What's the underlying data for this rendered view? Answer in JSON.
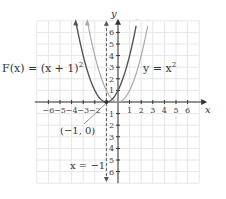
{
  "chart_data": {
    "type": "line",
    "title": "",
    "xlabel": "x",
    "ylabel": "y",
    "xlim": [
      -7,
      7
    ],
    "ylim": [
      -7,
      7
    ],
    "grid": true,
    "x_ticks": [
      -6,
      -5,
      -4,
      -3,
      -2,
      1,
      2,
      3,
      4,
      5,
      6
    ],
    "y_ticks": [
      6,
      5,
      4,
      3,
      2,
      1,
      -1,
      -2,
      -3,
      -4,
      -5,
      -6
    ],
    "series": [
      {
        "name": "F(x) = (x + 1)^2",
        "color": "#555555",
        "x": [
          -3.6,
          -3,
          -2,
          -1,
          0,
          1,
          1.6
        ],
        "y": [
          6.76,
          4,
          1,
          0,
          1,
          4,
          6.76
        ]
      },
      {
        "name": "y = x^2",
        "color": "#aaaaaa",
        "x": [
          -2.6,
          -2,
          -1,
          0,
          1,
          2,
          2.6
        ],
        "y": [
          6.76,
          4,
          1,
          0,
          1,
          4,
          6.76
        ]
      }
    ],
    "annotations": [
      {
        "text": "F(x) = (x + 1)^2",
        "target": "dark curve"
      },
      {
        "text": "y = x^2",
        "target": "light curve"
      },
      {
        "text": "(-1, 0)",
        "point": [
          -1,
          0
        ]
      },
      {
        "text": "x = -1",
        "type": "dashed vertical line (axis of symmetry)"
      }
    ]
  },
  "labels": {
    "f_label": "F(x) = (x + 1)",
    "f_exp": "2",
    "g_label": "y = x",
    "g_exp": "2",
    "vertex": "(−1, 0)",
    "axis_sym": "x = −1",
    "x_axis": "x",
    "y_axis": "y"
  },
  "ticks": {
    "x": [
      "−6",
      "−5",
      "−4",
      "−3",
      "−2",
      "1",
      "2",
      "3",
      "4",
      "5",
      "6"
    ],
    "y_pos": [
      "1",
      "2",
      "3",
      "4",
      "5",
      "6"
    ],
    "y_neg": [
      "1",
      "2",
      "3",
      "4",
      "5",
      "6"
    ]
  }
}
